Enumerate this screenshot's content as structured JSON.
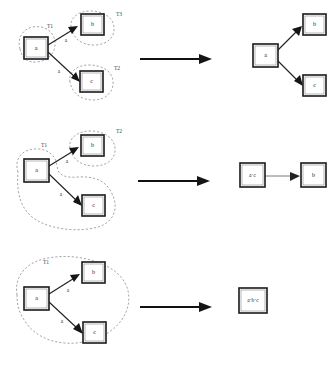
{
  "diagram": {
    "node_labels": {
      "a": "a",
      "b": "b",
      "c": "c"
    },
    "colors": {
      "node_stroke": "#1a1a1a",
      "blob_stroke": "#8a8a8a",
      "edge_stroke": "#1f1f1f",
      "text": "#2b2b2b",
      "background": "#ffffff"
    },
    "rows": [
      {
        "id": "row-1",
        "left": {
          "nodes": [
            {
              "id": "a",
              "label": "a"
            },
            {
              "id": "b",
              "label": "b"
            },
            {
              "id": "c",
              "label": "c"
            }
          ],
          "edges": [
            {
              "from": "a",
              "to": "b",
              "label": "a"
            },
            {
              "from": "a",
              "to": "c",
              "label": "a"
            }
          ],
          "groups": [
            {
              "id": "g1",
              "label": "T1",
              "members": [
                "a"
              ]
            },
            {
              "id": "g3",
              "label": "T3",
              "members": [
                "b"
              ]
            },
            {
              "id": "g2",
              "label": "T2",
              "members": [
                "c"
              ]
            }
          ]
        },
        "right": {
          "nodes": [
            {
              "id": "a",
              "label": "a"
            },
            {
              "id": "b",
              "label": "b"
            },
            {
              "id": "c",
              "label": "c"
            }
          ],
          "edges": [
            {
              "from": "a",
              "to": "b",
              "label": ""
            },
            {
              "from": "a",
              "to": "c",
              "label": ""
            }
          ]
        }
      },
      {
        "id": "row-2",
        "left": {
          "nodes": [
            {
              "id": "a",
              "label": "a"
            },
            {
              "id": "b",
              "label": "b"
            },
            {
              "id": "c",
              "label": "c"
            }
          ],
          "edges": [
            {
              "from": "a",
              "to": "b",
              "label": "a"
            },
            {
              "from": "a",
              "to": "c",
              "label": "a"
            }
          ],
          "groups": [
            {
              "id": "g1",
              "label": "T1",
              "members": [
                "a",
                "c"
              ]
            },
            {
              "id": "g2",
              "label": "T2",
              "members": [
                "b"
              ]
            }
          ]
        },
        "right": {
          "nodes": [
            {
              "id": "ac",
              "label": "a·c"
            },
            {
              "id": "b",
              "label": "b"
            }
          ],
          "edges": [
            {
              "from": "ac",
              "to": "b",
              "label": ""
            }
          ]
        }
      },
      {
        "id": "row-3",
        "left": {
          "nodes": [
            {
              "id": "a",
              "label": "a"
            },
            {
              "id": "b",
              "label": "b"
            },
            {
              "id": "c",
              "label": "c"
            }
          ],
          "edges": [
            {
              "from": "a",
              "to": "b",
              "label": "a"
            },
            {
              "from": "a",
              "to": "c",
              "label": "a"
            }
          ],
          "groups": [
            {
              "id": "g1",
              "label": "T1",
              "members": [
                "a",
                "b",
                "c"
              ]
            }
          ]
        },
        "right": {
          "nodes": [
            {
              "id": "abc",
              "label": "a·b·c"
            }
          ],
          "edges": []
        }
      }
    ]
  }
}
